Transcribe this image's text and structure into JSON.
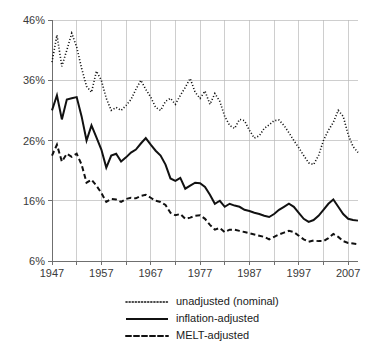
{
  "chart_data": {
    "type": "line",
    "title": "",
    "subtitle": "",
    "xlabel": "",
    "ylabel": "",
    "xlim": [
      1947,
      2009
    ],
    "ylim": [
      6,
      46
    ],
    "grid": true,
    "legend_position": "bottom",
    "y_ticks": [
      6,
      16,
      26,
      36,
      46
    ],
    "y_tick_labels": [
      "6%",
      "16%",
      "26%",
      "36%",
      "46%"
    ],
    "x_ticks": [
      1947,
      1957,
      1967,
      1977,
      1987,
      1997,
      2007
    ],
    "x_tick_labels": [
      "1947",
      "1957",
      "1967",
      "1977",
      "1987",
      "1997",
      "2007"
    ],
    "x_minor_ticks": [
      1952,
      1962,
      1972,
      1982,
      1992,
      2002
    ],
    "x": [
      1947,
      1948,
      1949,
      1950,
      1951,
      1952,
      1953,
      1954,
      1955,
      1956,
      1957,
      1958,
      1959,
      1960,
      1961,
      1962,
      1963,
      1964,
      1965,
      1966,
      1967,
      1968,
      1969,
      1970,
      1971,
      1972,
      1973,
      1974,
      1975,
      1976,
      1977,
      1978,
      1979,
      1980,
      1981,
      1982,
      1983,
      1984,
      1985,
      1986,
      1987,
      1988,
      1989,
      1990,
      1991,
      1992,
      1993,
      1994,
      1995,
      1996,
      1997,
      1998,
      1999,
      2000,
      2001,
      2002,
      2003,
      2004,
      2005,
      2006,
      2007,
      2008,
      2009
    ],
    "series": [
      {
        "name": "unadjusted (nominal)",
        "style": "dotted",
        "values": [
          39.0,
          43.5,
          38.3,
          41.0,
          43.8,
          41.5,
          38.0,
          35.0,
          34.0,
          37.5,
          36.0,
          33.0,
          31.0,
          31.5,
          31.0,
          31.8,
          32.8,
          34.5,
          36.0,
          34.5,
          33.2,
          31.5,
          31.0,
          32.5,
          33.0,
          32.0,
          33.5,
          34.8,
          36.3,
          34.0,
          33.0,
          34.2,
          32.0,
          33.8,
          32.5,
          30.0,
          28.5,
          28.0,
          29.5,
          29.3,
          27.7,
          26.4,
          26.8,
          28.0,
          28.6,
          29.3,
          29.4,
          28.5,
          27.3,
          26.0,
          24.8,
          23.5,
          22.3,
          22.0,
          23.5,
          26.0,
          27.7,
          29.0,
          31.0,
          30.0,
          27.0,
          25.0,
          24.0
        ]
      },
      {
        "name": "inflation-adjusted",
        "style": "solid",
        "values": [
          31.0,
          33.5,
          29.5,
          32.8,
          33.0,
          33.2,
          30.0,
          26.0,
          28.5,
          26.5,
          24.5,
          21.5,
          23.5,
          23.8,
          22.5,
          23.2,
          24.0,
          24.5,
          25.5,
          26.4,
          25.3,
          24.3,
          23.5,
          22.0,
          19.7,
          19.3,
          19.8,
          18.0,
          18.5,
          19.0,
          18.9,
          18.3,
          17.0,
          15.5,
          16.0,
          15.0,
          15.5,
          15.2,
          15.0,
          14.5,
          14.3,
          14.0,
          13.8,
          13.5,
          13.3,
          13.8,
          14.5,
          15.0,
          15.5,
          15.0,
          14.0,
          13.0,
          12.5,
          12.8,
          13.5,
          14.5,
          15.5,
          16.2,
          15.0,
          13.8,
          13.0,
          12.8,
          12.7
        ]
      },
      {
        "name": "MELT-adjusted",
        "style": "dashed",
        "values": [
          23.5,
          25.3,
          22.5,
          23.8,
          23.3,
          23.8,
          22.0,
          19.0,
          19.5,
          18.5,
          17.3,
          15.8,
          16.3,
          16.2,
          15.8,
          16.3,
          16.5,
          16.4,
          16.8,
          17.0,
          16.5,
          16.0,
          15.8,
          15.3,
          14.0,
          13.6,
          13.8,
          13.0,
          13.2,
          13.5,
          13.6,
          13.0,
          12.0,
          11.2,
          11.5,
          10.8,
          11.2,
          11.2,
          11.0,
          10.8,
          10.6,
          10.4,
          10.2,
          10.0,
          9.6,
          10.0,
          10.4,
          10.7,
          11.0,
          10.8,
          10.2,
          9.6,
          9.2,
          9.4,
          9.3,
          9.3,
          9.8,
          10.5,
          10.0,
          9.3,
          9.0,
          8.9,
          8.8
        ]
      }
    ],
    "legend_entries": [
      {
        "label": "unadjusted (nominal)",
        "style": "dotted"
      },
      {
        "label": "inflation-adjusted",
        "style": "solid"
      },
      {
        "label": "MELT-adjusted",
        "style": "dashed"
      }
    ],
    "colors": {
      "series_line": "#111111",
      "gridline": "#b9b9b9",
      "axis": "#6f6f6f",
      "tick_label": "#3a3a3a",
      "background": "#ffffff"
    }
  }
}
